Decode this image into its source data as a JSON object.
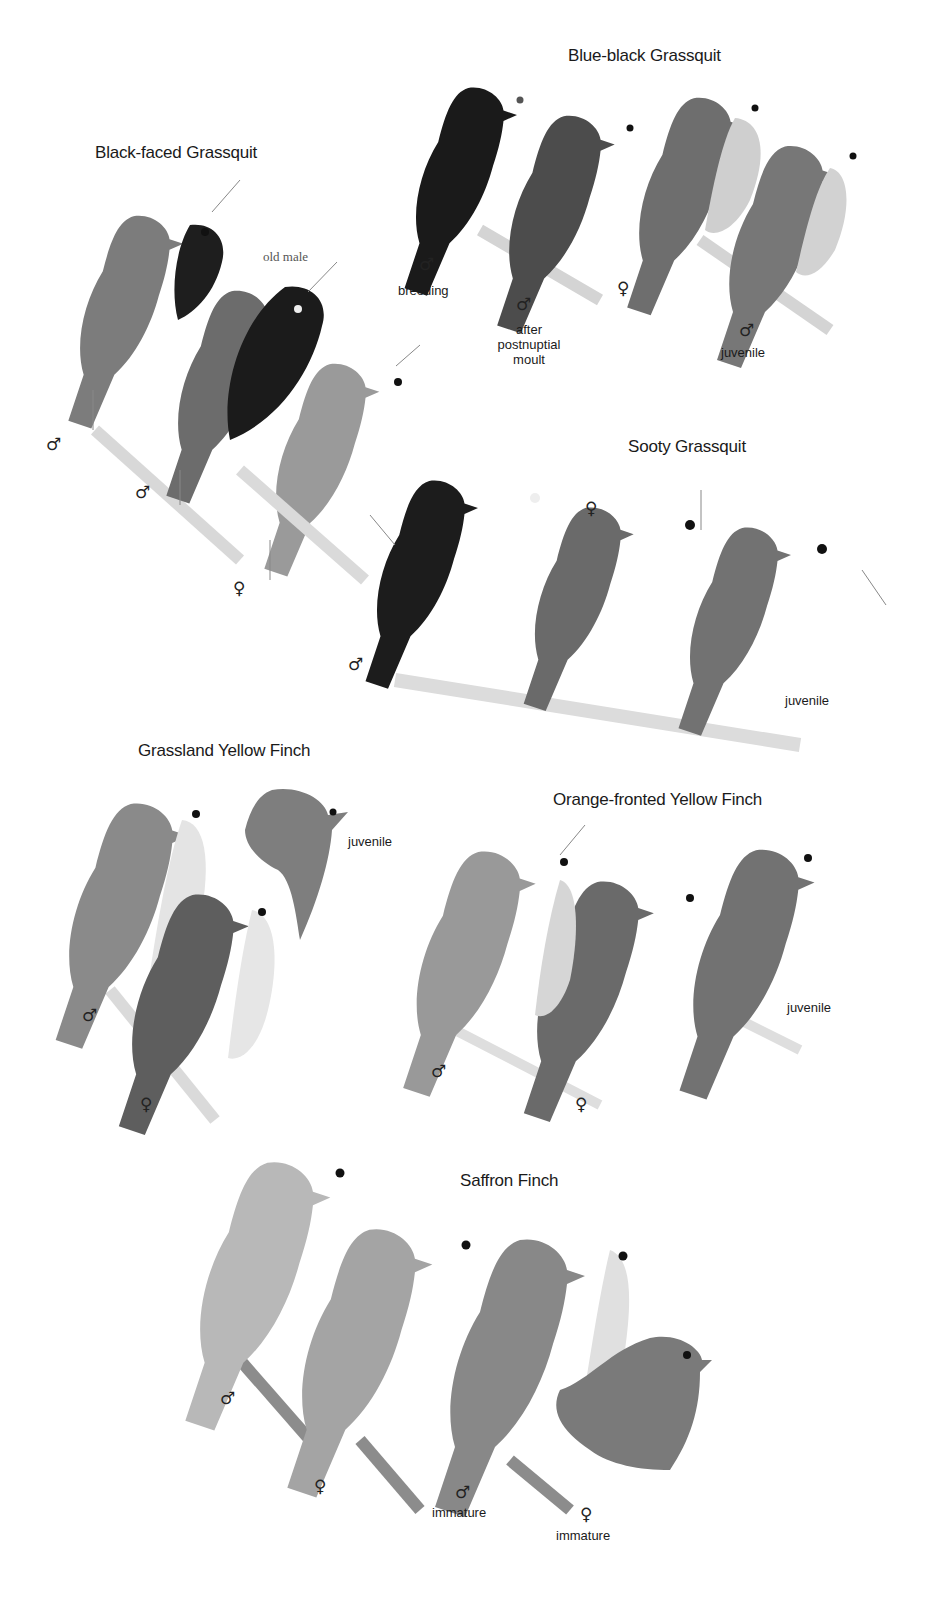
{
  "plate": {
    "species": [
      {
        "name": "Blue-black Grassquit",
        "figures": [
          {
            "sex": "♂",
            "label": "breeding"
          },
          {
            "sex": "♂",
            "label": "after postnuptial moult",
            "lines": [
              "after",
              "postnuptial",
              "moult"
            ]
          },
          {
            "sex": "♀",
            "label": ""
          },
          {
            "sex": "♂",
            "label": "juvenile"
          }
        ]
      },
      {
        "name": "Black-faced Grassquit",
        "figures": [
          {
            "sex": "♂",
            "label": ""
          },
          {
            "sex": "♂",
            "label": "old male"
          },
          {
            "sex": "♀",
            "label": ""
          }
        ]
      },
      {
        "name": "Sooty Grassquit",
        "figures": [
          {
            "sex": "♂",
            "label": ""
          },
          {
            "sex": "♀",
            "label": ""
          },
          {
            "sex": "",
            "label": "juvenile"
          }
        ]
      },
      {
        "name": "Grassland Yellow Finch",
        "figures": [
          {
            "sex": "♂",
            "label": ""
          },
          {
            "sex": "",
            "label": "juvenile"
          },
          {
            "sex": "♀",
            "label": ""
          }
        ]
      },
      {
        "name": "Orange-fronted Yellow Finch",
        "figures": [
          {
            "sex": "♂",
            "label": ""
          },
          {
            "sex": "♀",
            "label": ""
          },
          {
            "sex": "",
            "label": "juvenile"
          }
        ]
      },
      {
        "name": "Saffron Finch",
        "figures": [
          {
            "sex": "♂",
            "label": ""
          },
          {
            "sex": "♀",
            "label": ""
          },
          {
            "sex": "♂",
            "label": "immature"
          },
          {
            "sex": "♀",
            "label": "immature"
          }
        ]
      }
    ]
  },
  "colors": {
    "background": "#ffffff",
    "text": "#1a1a1a",
    "black_plumage": "#1c1c1c",
    "dark_grey_plumage": "#4a4a4a",
    "mid_grey_plumage": "#7a7a7a",
    "light_grey_plumage": "#b4b4b4",
    "pale_plumage": "#d6d6d6",
    "branch": "#d9d9d9"
  }
}
